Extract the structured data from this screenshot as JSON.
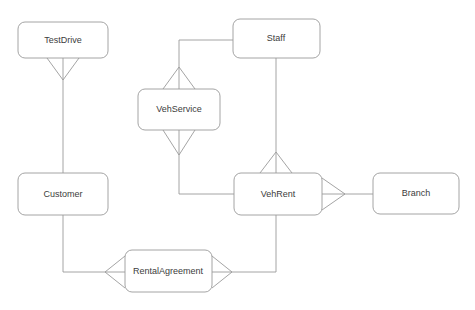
{
  "diagram": {
    "background_color": "#ffffff",
    "stroke_color": "#9a9a9a",
    "text_color": "#3c3c3c",
    "entities": [
      {
        "id": "testdrive",
        "label": "TestDrive",
        "x": 18,
        "y": 22,
        "w": 90,
        "h": 36
      },
      {
        "id": "customer",
        "label": "Customer",
        "x": 18,
        "y": 173,
        "w": 90,
        "h": 42
      },
      {
        "id": "vehservice",
        "label": "VehService",
        "x": 138,
        "y": 89,
        "w": 82,
        "h": 41
      },
      {
        "id": "staff",
        "label": "Staff",
        "x": 233,
        "y": 19,
        "w": 87,
        "h": 39
      },
      {
        "id": "vehrent",
        "label": "VehRent",
        "x": 234,
        "y": 173,
        "w": 88,
        "h": 42
      },
      {
        "id": "branch",
        "label": "Branch",
        "x": 373,
        "y": 173,
        "w": 86,
        "h": 41
      },
      {
        "id": "rentalagreement",
        "label": "RentalAgreement",
        "x": 125,
        "y": 250,
        "w": 87,
        "h": 42
      }
    ],
    "relationships": [
      {
        "id": "testdrive-customer",
        "from": "TestDrive",
        "to": "Customer",
        "from_cardinality": "many",
        "to_cardinality": "one"
      },
      {
        "id": "staff-vehservice",
        "from": "Staff",
        "to": "VehService",
        "from_cardinality": "one",
        "to_cardinality": "many"
      },
      {
        "id": "vehservice-vehrent",
        "from": "VehService",
        "to": "VehRent",
        "from_cardinality": "many",
        "to_cardinality": "one"
      },
      {
        "id": "staff-vehrent",
        "from": "Staff",
        "to": "VehRent",
        "from_cardinality": "one",
        "to_cardinality": "many"
      },
      {
        "id": "vehrent-branch",
        "from": "VehRent",
        "to": "Branch",
        "from_cardinality": "many",
        "to_cardinality": "one"
      },
      {
        "id": "vehrent-rentalagreement",
        "from": "VehRent",
        "to": "RentalAgreement",
        "from_cardinality": "one",
        "to_cardinality": "many"
      },
      {
        "id": "customer-rentalagreement",
        "from": "Customer",
        "to": "RentalAgreement",
        "from_cardinality": "one",
        "to_cardinality": "many"
      }
    ]
  }
}
